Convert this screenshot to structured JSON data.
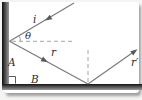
{
  "figure": {
    "labels": {
      "incident_ray": "i",
      "angle_theta": "θ",
      "reflected_ray": "r",
      "second_reflected_ray": "r′",
      "point_a": "A",
      "point_b": "B"
    },
    "colors": {
      "mirror_dark": "#0d0d0d",
      "mirror_light": "#9a9a9a",
      "ray": "#787878",
      "arrowhead": "#5a5a5a",
      "dashed_normal": "#9a9a9a",
      "label_text": "#2e2e2e",
      "background": "#ffffff"
    }
  }
}
